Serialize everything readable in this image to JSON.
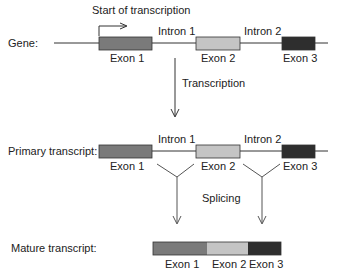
{
  "diagram": {
    "start_label": "Start of transcription",
    "gene": {
      "label": "Gene:",
      "exons": [
        "Exon 1",
        "Exon 2",
        "Exon 3"
      ],
      "introns": [
        "Intron 1",
        "Intron 2"
      ]
    },
    "step1": "Transcription",
    "primary": {
      "label": "Primary transcript:",
      "exons": [
        "Exon 1",
        "Exon 2",
        "Exon 3"
      ],
      "introns": [
        "Intron 1",
        "Intron 2"
      ]
    },
    "step2": "Splicing",
    "mature": {
      "label": "Mature transcript:",
      "exons": [
        "Exon 1",
        "Exon 2",
        "Exon 3"
      ]
    },
    "colors": {
      "exon1": "#7a7a7a",
      "exon2": "#c4c4c4",
      "exon3": "#2e2e2e",
      "line": "#333333"
    }
  }
}
